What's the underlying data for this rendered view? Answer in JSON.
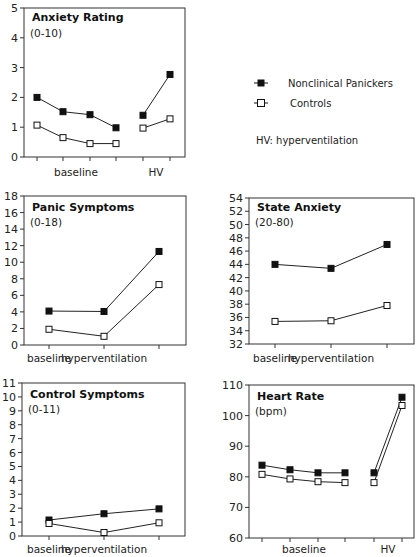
{
  "legend": {
    "series": [
      {
        "name": "Nonclinical Panickers",
        "marker": "filled-square"
      },
      {
        "name": "Controls",
        "marker": "open-square"
      }
    ],
    "note": "HV: hyperventilation"
  },
  "chart_data": [
    {
      "type": "line",
      "title": "Anxiety Rating",
      "subtitle": "(0-10)",
      "ylim": [
        0,
        5
      ],
      "yticks": [
        0,
        1,
        2,
        3,
        4,
        5
      ],
      "x_groups": [
        {
          "label": "baseline",
          "points": 4
        },
        {
          "label": "HV",
          "points": 2
        }
      ],
      "series": [
        {
          "name": "Nonclinical Panickers",
          "segments": [
            [
              2.0,
              1.52,
              1.42,
              0.98
            ],
            [
              1.4,
              2.77
            ]
          ]
        },
        {
          "name": "Controls",
          "segments": [
            [
              1.07,
              0.65,
              0.45,
              0.45
            ],
            [
              0.97,
              1.28
            ]
          ]
        }
      ]
    },
    {
      "type": "line",
      "title": "Panic Symptoms",
      "subtitle": "(0-18)",
      "ylim": [
        0,
        18
      ],
      "yticks": [
        0,
        2,
        4,
        6,
        8,
        10,
        12,
        14,
        16,
        18
      ],
      "categories": [
        "baseline",
        "hyperventilation",
        ""
      ],
      "series": [
        {
          "name": "Nonclinical Panickers",
          "values": [
            4.1,
            4.05,
            11.3
          ]
        },
        {
          "name": "Controls",
          "values": [
            1.9,
            1.05,
            7.3
          ]
        }
      ]
    },
    {
      "type": "line",
      "title": "State Anxiety",
      "subtitle": "(20-80)",
      "ylim": [
        32,
        54
      ],
      "yticks": [
        32,
        34,
        36,
        38,
        40,
        42,
        44,
        46,
        48,
        50,
        52,
        54
      ],
      "categories": [
        "baseline",
        "hyperventilation",
        ""
      ],
      "series": [
        {
          "name": "Nonclinical Panickers",
          "values": [
            44.0,
            43.4,
            47.0
          ]
        },
        {
          "name": "Controls",
          "values": [
            35.4,
            35.5,
            37.8
          ]
        }
      ]
    },
    {
      "type": "line",
      "title": "Control Symptoms",
      "subtitle": "(0-11)",
      "ylim": [
        0,
        11
      ],
      "yticks": [
        0,
        1,
        2,
        3,
        4,
        5,
        6,
        7,
        8,
        9,
        10,
        11
      ],
      "categories": [
        "baseline",
        "hyperventilation",
        ""
      ],
      "series": [
        {
          "name": "Nonclinical Panickers",
          "values": [
            1.15,
            1.6,
            1.95
          ]
        },
        {
          "name": "Controls",
          "values": [
            0.9,
            0.25,
            0.95
          ]
        }
      ]
    },
    {
      "type": "line",
      "title": "Heart Rate",
      "subtitle": "(bpm)",
      "ylim": [
        60,
        110
      ],
      "yticks": [
        60,
        70,
        80,
        90,
        100,
        110
      ],
      "x_groups": [
        {
          "label": "baseline",
          "points": 4
        },
        {
          "label": "HV",
          "points": 2
        }
      ],
      "series": [
        {
          "name": "Nonclinical Panickers",
          "segments": [
            [
              83.8,
              82.3,
              81.3,
              81.3
            ],
            [
              81.3,
              106.0
            ]
          ]
        },
        {
          "name": "Controls",
          "segments": [
            [
              80.8,
              79.3,
              78.4,
              78.1
            ],
            [
              78.1,
              103.3
            ]
          ]
        }
      ]
    }
  ]
}
